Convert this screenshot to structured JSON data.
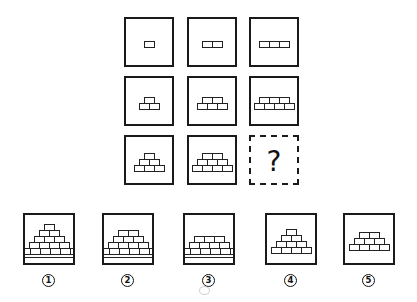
{
  "puzzle": {
    "grid": [
      {
        "row": 1,
        "col": 1,
        "rows": [
          1
        ]
      },
      {
        "row": 1,
        "col": 2,
        "rows": [
          2
        ]
      },
      {
        "row": 1,
        "col": 3,
        "rows": [
          3
        ]
      },
      {
        "row": 2,
        "col": 1,
        "rows": [
          1,
          2
        ]
      },
      {
        "row": 2,
        "col": 2,
        "rows": [
          2,
          3
        ]
      },
      {
        "row": 2,
        "col": 3,
        "rows": [
          3,
          4
        ]
      },
      {
        "row": 3,
        "col": 1,
        "rows": [
          1,
          2,
          3
        ]
      },
      {
        "row": 3,
        "col": 2,
        "rows": [
          2,
          3,
          4
        ]
      },
      {
        "row": 3,
        "col": 3,
        "unknown": true,
        "symbol": "?"
      }
    ],
    "options": [
      {
        "label": "1",
        "rows": [
          1,
          2,
          3,
          4
        ],
        "base": true
      },
      {
        "label": "2",
        "rows": [
          2,
          3,
          4
        ],
        "base": true
      },
      {
        "label": "3",
        "rows": [
          3,
          4
        ],
        "base": true
      },
      {
        "label": "4",
        "rows": [
          1,
          2,
          3,
          4
        ],
        "base": false
      },
      {
        "label": "5",
        "rows": [
          2,
          3,
          4
        ],
        "base": false
      }
    ],
    "question_symbol": "?",
    "label_glyphs": [
      "①",
      "②",
      "③",
      "④",
      "⑤"
    ],
    "colors": {
      "line": "#1a1a1a",
      "background": "#ffffff"
    }
  }
}
